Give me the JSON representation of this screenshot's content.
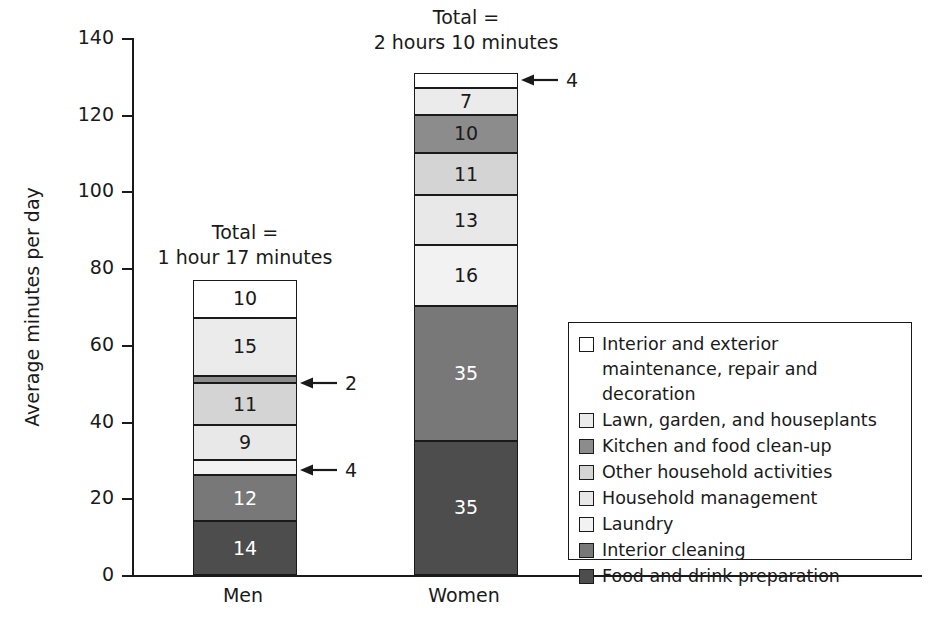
{
  "chart_data": {
    "type": "bar",
    "subtype": "stacked-bar",
    "title": "",
    "xlabel": "",
    "ylabel": "Average minutes per day",
    "ylim": [
      0,
      140
    ],
    "yticks": [
      0,
      20,
      40,
      60,
      80,
      100,
      120,
      140
    ],
    "grid": false,
    "legend_position": "inside-right",
    "categories": [
      "Men",
      "Women"
    ],
    "series": [
      {
        "name": "Food and drink preparation",
        "color": "#4d4d4d",
        "label_color": "#ffffff",
        "values": [
          14,
          35
        ]
      },
      {
        "name": "Interior cleaning",
        "color": "#787878",
        "label_color": "#ffffff",
        "values": [
          12,
          35
        ]
      },
      {
        "name": "Laundry",
        "color": "#f2f2f2",
        "label_color": "#1a1a1a",
        "values": [
          4,
          16
        ]
      },
      {
        "name": "Household management",
        "color": "#e8e8e8",
        "label_color": "#1a1a1a",
        "values": [
          9,
          13
        ]
      },
      {
        "name": "Other household activities",
        "color": "#d4d4d4",
        "label_color": "#1a1a1a",
        "values": [
          11,
          11
        ]
      },
      {
        "name": "Kitchen and food clean-up",
        "color": "#8c8c8c",
        "label_color": "#1a1a1a",
        "values": [
          2,
          10
        ]
      },
      {
        "name": "Lawn, garden, and houseplants",
        "color": "#ebebeb",
        "label_color": "#1a1a1a",
        "values": [
          15,
          7
        ]
      },
      {
        "name": "Interior and exterior maintenance, repair and decoration",
        "color": "#ffffff",
        "label_color": "#1a1a1a",
        "values": [
          10,
          4
        ]
      }
    ],
    "totals": [
      77,
      130
    ],
    "annotations": [
      {
        "category": "Men",
        "text": "Total =",
        "text2": "1 hour 17 minutes"
      },
      {
        "category": "Women",
        "text": "Total =",
        "text2": "2 hours 10 minutes"
      }
    ],
    "callouts": [
      {
        "category": "Men",
        "series": "Kitchen and food clean-up",
        "value": "2"
      },
      {
        "category": "Men",
        "series": "Laundry",
        "value": "4"
      },
      {
        "category": "Women",
        "series": "Interior and exterior maintenance, repair and decoration",
        "value": "4"
      }
    ]
  },
  "axis": {
    "y_title": "Average minutes per day",
    "y_ticks": [
      "140",
      "120",
      "100",
      "80",
      "60",
      "40",
      "20",
      "0"
    ],
    "x_categories": [
      "Men",
      "Women"
    ]
  },
  "bars": {
    "men": {
      "category_label": "Men",
      "total_line1": "Total =",
      "total_line2": "1 hour 17 minutes",
      "segments": [
        {
          "label": "10",
          "show_label": true
        },
        {
          "label": "15",
          "show_label": true
        },
        {
          "label": "2",
          "show_label": false
        },
        {
          "label": "11",
          "show_label": true
        },
        {
          "label": "9",
          "show_label": true
        },
        {
          "label": "4",
          "show_label": false
        },
        {
          "label": "12",
          "show_label": true
        },
        {
          "label": "14",
          "show_label": true
        }
      ]
    },
    "women": {
      "category_label": "Women",
      "total_line1": "Total =",
      "total_line2": "2 hours 10 minutes",
      "segments": [
        {
          "label": "4",
          "show_label": false
        },
        {
          "label": "7",
          "show_label": true
        },
        {
          "label": "10",
          "show_label": true
        },
        {
          "label": "11",
          "show_label": true
        },
        {
          "label": "13",
          "show_label": true
        },
        {
          "label": "16",
          "show_label": true
        },
        {
          "label": "35",
          "show_label": true
        },
        {
          "label": "35",
          "show_label": true
        }
      ]
    }
  },
  "callout_labels": {
    "men_kitchen": "2",
    "men_laundry": "4",
    "women_maintenance": "4"
  },
  "legend": {
    "items": [
      {
        "label": "Interior and exterior maintenance, repair and decoration",
        "color": "#ffffff"
      },
      {
        "label": "Lawn, garden, and houseplants",
        "color": "#ebebeb"
      },
      {
        "label": "Kitchen and food clean-up",
        "color": "#8c8c8c"
      },
      {
        "label": "Other household activities",
        "color": "#d4d4d4"
      },
      {
        "label": "Household management",
        "color": "#e8e8e8"
      },
      {
        "label": "Laundry",
        "color": "#f2f2f2"
      },
      {
        "label": "Interior cleaning",
        "color": "#787878"
      },
      {
        "label": "Food and drink preparation",
        "color": "#4d4d4d"
      }
    ]
  },
  "colors": {
    "axis": "#1a1a1a",
    "background": "#ffffff"
  }
}
